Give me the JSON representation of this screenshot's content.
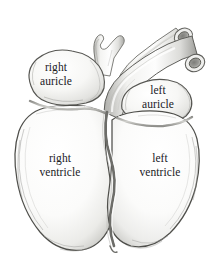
{
  "figure": {
    "style": "pencil / engraving shaded line drawing",
    "background_color": "#ffffff",
    "ink_color": "#20201e",
    "outline_color": "#4a4a48",
    "shade_light": "#f2f2f0",
    "shade_mid": "#d8d8d5",
    "shade_dark": "#a9a9a6"
  },
  "labels": {
    "right_auricle": {
      "line1": "right",
      "line2": "auricle"
    },
    "left_auricle": {
      "line1": "left",
      "line2": "auricle"
    },
    "right_ventricle": {
      "line1": "right",
      "line2": "ventricle"
    },
    "left_ventricle": {
      "line1": "left",
      "line2": "ventricle"
    }
  },
  "structures": [
    {
      "name": "right-auricle",
      "kind": "chamber"
    },
    {
      "name": "left-auricle",
      "kind": "chamber"
    },
    {
      "name": "right-ventricle",
      "kind": "chamber"
    },
    {
      "name": "left-ventricle",
      "kind": "chamber"
    },
    {
      "name": "aorta",
      "kind": "great-vessel"
    },
    {
      "name": "pulmonary-artery",
      "kind": "great-vessel"
    },
    {
      "name": "vessel-branch",
      "kind": "great-vessel"
    },
    {
      "name": "coronary-sulcus",
      "kind": "groove"
    },
    {
      "name": "interventricular-groove",
      "kind": "groove"
    }
  ]
}
